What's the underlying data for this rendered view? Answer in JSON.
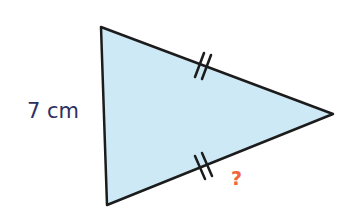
{
  "diagram": {
    "type": "isosceles-triangle",
    "vertices": {
      "top_left": [
        101,
        27
      ],
      "bottom_left": [
        107,
        205
      ],
      "right": [
        333,
        114
      ]
    },
    "colors": {
      "fill": "#cde9f5",
      "stroke": "#1c1c1c",
      "side_label": "#2e3160",
      "unknown_label": "#f2643c"
    },
    "labels": {
      "left_side": "7 cm",
      "unknown_side": "?"
    },
    "tick_marks": {
      "top_side": "double",
      "bottom_side": "double"
    }
  }
}
